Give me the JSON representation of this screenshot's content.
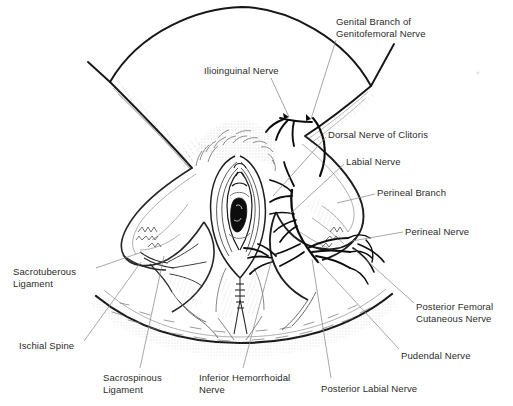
{
  "figure": {
    "background_color": "#ffffff",
    "ink_color": "#1a1a1a",
    "text_color": "#2b2b2b",
    "leader_color": "#8a8a8a",
    "width": 513,
    "height": 406
  },
  "labels": [
    {
      "id": "genital-branch-of-genitofemoral-nerve",
      "line1": "Genital Branch of",
      "line2": "Genitofemoral Nerve",
      "x": 336,
      "y": 16
    },
    {
      "id": "ilioinguinal-nerve",
      "line1": "Ilioinguinal Nerve",
      "line2": "",
      "x": 204,
      "y": 65
    },
    {
      "id": "dorsal-nerve-of-clitoris",
      "line1": "Dorsal Nerve of Clitoris",
      "line2": "",
      "x": 328,
      "y": 129
    },
    {
      "id": "labial-nerve",
      "line1": "Labial Nerve",
      "line2": "",
      "x": 346,
      "y": 156
    },
    {
      "id": "perineal-branch",
      "line1": "Perineal Branch",
      "line2": "",
      "x": 377,
      "y": 187
    },
    {
      "id": "perineal-nerve",
      "line1": "Perineal Nerve",
      "line2": "",
      "x": 405,
      "y": 226
    },
    {
      "id": "sacrotuberous-ligament",
      "line1": "Sacrotuberous",
      "line2": "Ligament",
      "x": 13,
      "y": 266
    },
    {
      "id": "ischial-spine",
      "line1": "Ischial Spine",
      "line2": "",
      "x": 19,
      "y": 340
    },
    {
      "id": "posterior-femoral-cutaneous-nerve",
      "line1": "Posterior Femoral",
      "line2": "Cutaneous Nerve",
      "x": 416,
      "y": 301
    },
    {
      "id": "pudendal-nerve",
      "line1": "Pudendal Nerve",
      "line2": "",
      "x": 401,
      "y": 350
    },
    {
      "id": "sacrospinous-ligament",
      "line1": "Sacrospinous",
      "line2": "Ligament",
      "x": 103,
      "y": 372
    },
    {
      "id": "inferior-hemorrhoidal-nerve",
      "line1": "Inferior Hemorrhoidal",
      "line2": "Nerve",
      "x": 199,
      "y": 372
    },
    {
      "id": "posterior-labial-nerve",
      "line1": "Posterior Labial Nerve",
      "line2": "",
      "x": 321,
      "y": 383
    }
  ],
  "leader_lines": [
    {
      "id": "leader-genital-branch",
      "from": [
        336,
        40
      ],
      "to": [
        311,
        119
      ]
    },
    {
      "id": "leader-ilioinguinal",
      "from": [
        271,
        78
      ],
      "to": [
        287,
        116
      ]
    },
    {
      "id": "leader-dorsal-nerve-of-clitoris",
      "from": [
        326,
        137
      ],
      "to": [
        273,
        194
      ]
    },
    {
      "id": "leader-labial-nerve",
      "from": [
        344,
        164
      ],
      "to": [
        289,
        214
      ]
    },
    {
      "id": "leader-perineal-branch",
      "from": [
        375,
        194
      ],
      "to": [
        338,
        203
      ]
    },
    {
      "id": "leader-perineal-nerve",
      "from": [
        403,
        232
      ],
      "to": [
        353,
        241
      ]
    },
    {
      "id": "leader-sacrotuberous",
      "from": [
        96,
        268
      ],
      "to": [
        141,
        251
      ]
    },
    {
      "id": "leader-ischial-spine",
      "from": [
        84,
        341
      ],
      "to": [
        140,
        262
      ]
    },
    {
      "id": "leader-posterior-femoral",
      "from": [
        414,
        303
      ],
      "to": [
        353,
        249
      ]
    },
    {
      "id": "leader-pudendal",
      "from": [
        399,
        349
      ],
      "to": [
        318,
        261
      ]
    },
    {
      "id": "leader-sacrospinous",
      "from": [
        140,
        368
      ],
      "to": [
        163,
        255
      ]
    },
    {
      "id": "leader-inferior-hemorrhoidal",
      "from": [
        243,
        368
      ],
      "to": [
        272,
        258
      ]
    },
    {
      "id": "leader-posterior-labial",
      "from": [
        331,
        378
      ],
      "to": [
        312,
        258
      ]
    }
  ],
  "anatomy_notes": {
    "upper_arc": "mons / abdominal wall arc peaking near x=242 y=7",
    "lower_arc": "gluteal / posterior arc dipping near x=240 y=343",
    "left_thigh": "left thigh mass with ischial tuberosity detail",
    "right_thigh": "right thigh mass with labial and perineal nerve branching",
    "midline": "vulva with labia majora, labia minora, vaginal introitus and anal region"
  }
}
